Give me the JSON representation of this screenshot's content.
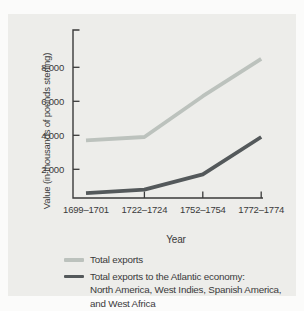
{
  "chart_data": {
    "type": "line",
    "title": "",
    "xlabel": "Year",
    "ylabel": "Value (in thousands of pounds sterling)",
    "categories": [
      "1699–1701",
      "1722–1724",
      "1752–1754",
      "1772–1774"
    ],
    "y_ticks": [
      {
        "value": 2000,
        "label": "2,000"
      },
      {
        "value": 4000,
        "label": "4,000"
      },
      {
        "value": 6000,
        "label": "6,000"
      },
      {
        "value": 8000,
        "label": "8,000"
      }
    ],
    "ylim": [
      0,
      9800
    ],
    "grid": false,
    "legend_position": "bottom-left",
    "axis_color": "#3a3a3a",
    "series": [
      {
        "name": "Total exports",
        "color": "#bcc2bd",
        "values": [
          3700,
          3900,
          6300,
          8500
        ],
        "legend_lines": [
          "Total exports"
        ]
      },
      {
        "name": "Total exports to the Atlantic economy: North America, West Indies, Spanish America, and West Africa",
        "color": "#54595b",
        "values": [
          600,
          800,
          1700,
          3900
        ],
        "legend_lines": [
          "Total exports to the Atlantic economy:",
          "North America, West Indies, Spanish America,",
          "and West Africa"
        ]
      }
    ]
  }
}
